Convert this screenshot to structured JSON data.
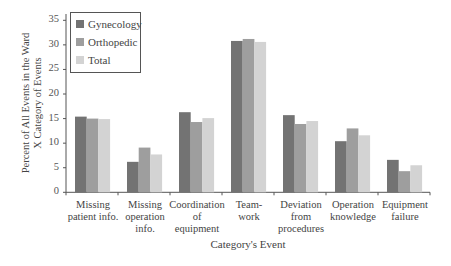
{
  "chart_data": {
    "type": "bar",
    "title": "",
    "xlabel": "Category's Event",
    "ylabel_lines": [
      "Percent of All Events in the Ward",
      "X Category of Events"
    ],
    "ylim": [
      0,
      35
    ],
    "yticks": [
      0,
      5,
      10,
      15,
      20,
      25,
      30,
      35
    ],
    "grid": false,
    "legend_position": "upper left (inside)",
    "categories": [
      [
        "Missing",
        "patient info."
      ],
      [
        "Missing",
        "operation",
        "info."
      ],
      [
        "Coordination",
        "of",
        "equipment"
      ],
      [
        "Team-",
        "work"
      ],
      [
        "Deviation",
        "from",
        "procedures"
      ],
      [
        "Operation",
        "knowledge"
      ],
      [
        "Equipment",
        "failure"
      ]
    ],
    "series": [
      {
        "name": "Gynecology",
        "color": "#737373",
        "values": [
          15.4,
          6.2,
          16.3,
          30.8,
          15.7,
          10.4,
          6.6
        ]
      },
      {
        "name": "Orthopedic",
        "color": "#9e9e9e",
        "values": [
          15.0,
          9.1,
          14.3,
          31.2,
          13.9,
          13.0,
          4.3
        ]
      },
      {
        "name": "Total",
        "color": "#d3d3d3",
        "values": [
          14.9,
          7.7,
          15.1,
          30.6,
          14.5,
          11.6,
          5.5
        ]
      }
    ]
  }
}
